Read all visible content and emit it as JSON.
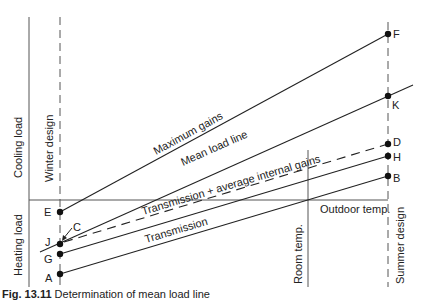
{
  "figure": {
    "caption_number": "Fig. 13.11",
    "caption_text": "Determination of mean load line",
    "colors": {
      "line": "#222222",
      "axis": "#555555",
      "dash": "#555555",
      "background": "#ffffff"
    }
  },
  "axes": {
    "y_upper_label": "Cooling load",
    "y_lower_label": "Heating load",
    "x_label": "Outdoor temp.",
    "winter_design_label": "Winter design",
    "summer_design_label": "Summer design",
    "room_temp_label": "Room temp."
  },
  "lines": [
    {
      "name": "Maximum gains",
      "from": "E",
      "to": "F",
      "style": "solid"
    },
    {
      "name": "Mean load line",
      "from": "J",
      "to": "K",
      "style": "solid"
    },
    {
      "name": "Transmission + average internal gains",
      "from": "C",
      "to": "D",
      "style": "dashed"
    },
    {
      "name": "Transmission + average internal gains (solid)",
      "from": "G",
      "to": "H",
      "style": "solid"
    },
    {
      "name": "Transmission",
      "from": "A",
      "to": "B",
      "style": "solid"
    }
  ],
  "points": {
    "A": "A",
    "B": "B",
    "C": "C",
    "D": "D",
    "E": "E",
    "F": "F",
    "G": "G",
    "H": "H",
    "J": "J",
    "K": "K"
  },
  "line_labels": {
    "max_gains": "Maximum gains",
    "mean_load": "Mean load line",
    "trans_avg": "Transmission + average internal gains",
    "transmission": "Transmission"
  }
}
